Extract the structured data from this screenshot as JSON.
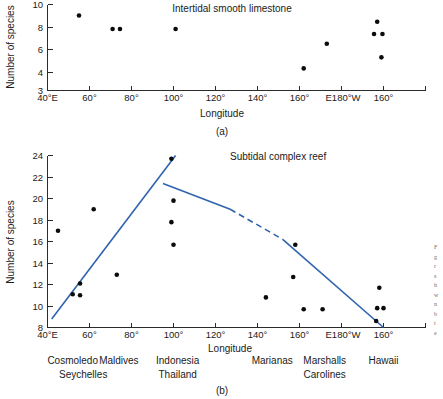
{
  "figure": {
    "panel_a_label": "(a)",
    "panel_b_label": "(b)",
    "edge_caption_fragment": "Figure"
  },
  "chart_data": [
    {
      "id": "panel-a",
      "type": "scatter",
      "title": "Intertidal smooth limestone",
      "xlabel": "Longitude",
      "ylabel": "Number of species",
      "ylim": [
        3,
        10
      ],
      "yticks": [
        4,
        6,
        8,
        10
      ],
      "ytick_labels": [
        "4",
        "6",
        "8",
        "10"
      ],
      "xlim": [
        40,
        220
      ],
      "xticks": [
        40,
        60,
        80,
        100,
        120,
        140,
        160,
        180,
        200
      ],
      "xtick_labels": [
        "40°E",
        "60°",
        "80°",
        "100°",
        "120°",
        "140°",
        "160°",
        "E180°W",
        "160°"
      ],
      "grid": false,
      "legend": "none",
      "points": [
        {
          "x": 55,
          "y": 9.1
        },
        {
          "x": 71,
          "y": 8.0
        },
        {
          "x": 74.5,
          "y": 8.0
        },
        {
          "x": 101,
          "y": 8.0
        },
        {
          "x": 162,
          "y": 4.8
        },
        {
          "x": 173,
          "y": 6.8
        },
        {
          "x": 197,
          "y": 8.6
        },
        {
          "x": 195.5,
          "y": 7.6
        },
        {
          "x": 199.5,
          "y": 7.6
        },
        {
          "x": 199,
          "y": 5.7
        }
      ]
    },
    {
      "id": "panel-b",
      "type": "scatter",
      "title": "Subtidal complex reef",
      "xlabel": "Longitude",
      "ylabel": "Number of species",
      "ylim": [
        8,
        24
      ],
      "yticks": [
        8,
        10,
        12,
        14,
        16,
        18,
        20,
        22,
        24
      ],
      "ytick_labels": [
        "8",
        "10",
        "12",
        "14",
        "16",
        "18",
        "20",
        "22",
        "24"
      ],
      "xlim": [
        40,
        220
      ],
      "xticks": [
        40,
        60,
        80,
        100,
        120,
        140,
        160,
        180,
        200
      ],
      "xtick_labels": [
        "40°E",
        "60°",
        "80°",
        "100°",
        "120°",
        "140°",
        "160°",
        "E180°W",
        "160°"
      ],
      "grid": false,
      "legend": "none",
      "points": [
        {
          "x": 45,
          "y": 17.0
        },
        {
          "x": 52,
          "y": 11.1
        },
        {
          "x": 55.5,
          "y": 12.1
        },
        {
          "x": 55.5,
          "y": 11.0
        },
        {
          "x": 62,
          "y": 19.0
        },
        {
          "x": 73,
          "y": 12.9
        },
        {
          "x": 99,
          "y": 23.7
        },
        {
          "x": 100,
          "y": 19.8
        },
        {
          "x": 99,
          "y": 17.8
        },
        {
          "x": 100,
          "y": 15.7
        },
        {
          "x": 144,
          "y": 10.8
        },
        {
          "x": 157,
          "y": 12.7
        },
        {
          "x": 162,
          "y": 9.7
        },
        {
          "x": 171,
          "y": 9.7
        },
        {
          "x": 158,
          "y": 15.7
        },
        {
          "x": 198,
          "y": 11.7
        },
        {
          "x": 197,
          "y": 9.8
        },
        {
          "x": 200,
          "y": 9.8
        },
        {
          "x": 196.5,
          "y": 8.6
        }
      ],
      "trend_lines": [
        {
          "name": "rising-limb",
          "style": "solid",
          "x1": 42,
          "y1": 8.8,
          "x2": 101,
          "y2": 24.0
        },
        {
          "name": "falling-limb-solid-left",
          "style": "solid",
          "x1": 95,
          "y1": 21.4,
          "x2": 127,
          "y2": 19.0
        },
        {
          "name": "falling-limb-dashed",
          "style": "dashed",
          "x1": 127,
          "y1": 19.0,
          "x2": 152,
          "y2": 16.2
        },
        {
          "name": "falling-limb-solid-right",
          "style": "solid",
          "x1": 152,
          "y1": 16.2,
          "x2": 200,
          "y2": 8.0
        }
      ],
      "location_labels_row1": [
        {
          "label": "Cosmoledo",
          "x": 52
        },
        {
          "label": "Maldives",
          "x": 74
        },
        {
          "label": "Indonesia",
          "x": 102
        },
        {
          "label": "Marianas",
          "x": 147
        },
        {
          "label": "Marshalls",
          "x": 172
        },
        {
          "label": "Hawaii",
          "x": 200
        }
      ],
      "location_labels_row2": [
        {
          "label": "Seychelles",
          "x": 57
        },
        {
          "label": "Thailand",
          "x": 102
        },
        {
          "label": "Carolines",
          "x": 172
        }
      ]
    }
  ]
}
